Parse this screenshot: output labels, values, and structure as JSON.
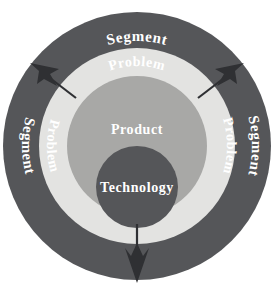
{
  "diagram": {
    "type": "concentric-rings",
    "background_color": "#ffffff",
    "rings": [
      {
        "id": "segment",
        "label": "Segment",
        "role": "outer-ring",
        "fill": "#555659",
        "text_color": "#ffffff",
        "label_positions": [
          "top",
          "left",
          "right"
        ]
      },
      {
        "id": "problem",
        "label": "Problem",
        "role": "second-ring",
        "fill": "#e3e3e1",
        "text_color": "#ffffff",
        "label_positions": [
          "top",
          "left",
          "right"
        ]
      },
      {
        "id": "product",
        "label": "Product",
        "role": "third-ring",
        "fill": "#a8a8a6",
        "text_color": "#ffffff",
        "label_positions": [
          "center-upper"
        ]
      },
      {
        "id": "technology",
        "label": "Technology",
        "role": "core-circle",
        "fill": "#555659",
        "text_color": "#ffffff",
        "label_positions": [
          "center"
        ]
      }
    ],
    "arrows": [
      {
        "id": "arrow-upper-left",
        "label": "",
        "direction": "outward-up-left",
        "color": "#2f3033"
      },
      {
        "id": "arrow-upper-right",
        "label": "",
        "direction": "outward-up-right",
        "color": "#2f3033"
      },
      {
        "id": "arrow-bottom",
        "label": "",
        "direction": "outward-down",
        "color": "#2f3033"
      }
    ],
    "labels": {
      "segment_top": "Segment",
      "segment_left": "Segment",
      "segment_right": "Segment",
      "problem_top": "Problem",
      "problem_left": "Problem",
      "problem_right": "Problem",
      "product_center": "Product",
      "technology_center": "Technology"
    }
  }
}
